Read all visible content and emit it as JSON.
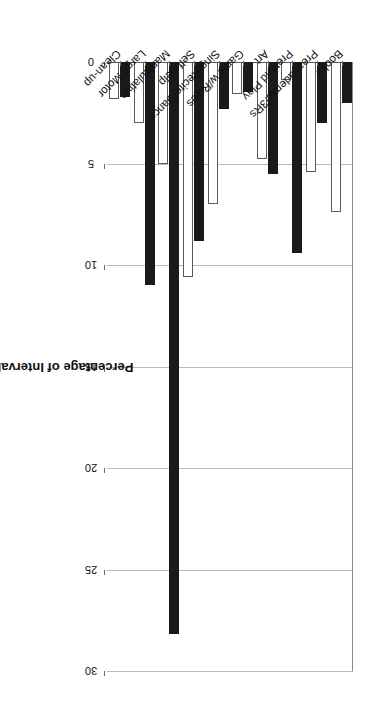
{
  "chart_data": {
    "type": "bar",
    "title": "",
    "subtitle": "",
    "xlabel": "",
    "ylabel": "Percentage of Intervals",
    "orientation": "vertical-rotated-180",
    "grid": true,
    "legend_position": "none",
    "ylim": [
      0,
      30
    ],
    "yticks": [
      0,
      5,
      10,
      15,
      20,
      25,
      30
    ],
    "ytick_labels": [
      "0",
      "5",
      "10",
      "15",
      "20",
      "25",
      "30"
    ],
    "categories": [
      "Books",
      "Preacademic/3Rs",
      "Pretend Play",
      "Art",
      "Game w/Rules",
      "Sing/Recite/Dance",
      "Self-help",
      "Manipulative",
      "Large Motor",
      "Clean-up"
    ],
    "series": [
      {
        "name": "Series 1",
        "style": "filled-black",
        "color": "#1a1a1a",
        "values": [
          2.0,
          3.0,
          9.4,
          5.5,
          1.5,
          2.3,
          8.8,
          28.2,
          11.0,
          1.7
        ]
      },
      {
        "name": "Series 2",
        "style": "open-white",
        "color": "#ffffff",
        "values": [
          7.4,
          5.4,
          0.9,
          4.8,
          1.6,
          7.0,
          10.6,
          5.0,
          3.0,
          1.8
        ]
      }
    ],
    "annotations": []
  },
  "axis": {
    "value_axis_title": "Percentage of Intervals",
    "category_axis_title": ""
  }
}
